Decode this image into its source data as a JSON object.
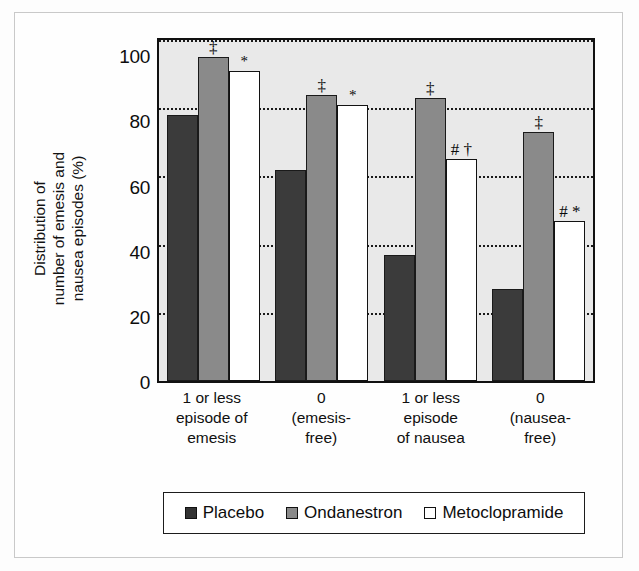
{
  "chart_data": {
    "type": "bar",
    "title": "",
    "xlabel": "",
    "ylabel": "Distribution of number of emesis and nausea episodes (%)",
    "ylabel_lines": [
      "Distribution of",
      "number of emesis and",
      "nausea episodes (%)"
    ],
    "ylim": [
      0,
      100
    ],
    "yticks": [
      100,
      80,
      60,
      40,
      20,
      0
    ],
    "grid": "horizontal-dotted",
    "legend_position": "bottom",
    "categories": [
      "1 or less episode of emesis",
      "0 (emesis-free)",
      "1 or less episode of nausea",
      "0 (nausea-free)"
    ],
    "category_lines": [
      [
        "1 or less",
        "episode of",
        "emesis"
      ],
      [
        "0",
        "(emesis-",
        "free)"
      ],
      [
        "1 or less",
        "episode",
        "of nausea"
      ],
      [
        "0",
        "(nausea-",
        "free)"
      ]
    ],
    "series": [
      {
        "name": "Placebo",
        "color": "#3b3b3b",
        "values": [
          78,
          62,
          37,
          27
        ]
      },
      {
        "name": "Ondanestron",
        "color": "#8a8a8a",
        "values": [
          95,
          84,
          83,
          73
        ]
      },
      {
        "name": "Metoclopramide",
        "color": "#ffffff",
        "values": [
          91,
          81,
          65,
          47
        ]
      }
    ],
    "annotations": [
      {
        "group": 0,
        "series": "Placebo",
        "mark": ""
      },
      {
        "group": 0,
        "series": "Ondanestron",
        "mark": "‡"
      },
      {
        "group": 0,
        "series": "Metoclopramide",
        "mark": "*"
      },
      {
        "group": 1,
        "series": "Placebo",
        "mark": ""
      },
      {
        "group": 1,
        "series": "Ondanestron",
        "mark": "‡"
      },
      {
        "group": 1,
        "series": "Metoclopramide",
        "mark": "*"
      },
      {
        "group": 2,
        "series": "Placebo",
        "mark": ""
      },
      {
        "group": 2,
        "series": "Ondanestron",
        "mark": "‡"
      },
      {
        "group": 2,
        "series": "Metoclopramide",
        "mark": "# †"
      },
      {
        "group": 3,
        "series": "Placebo",
        "mark": ""
      },
      {
        "group": 3,
        "series": "Ondanestron",
        "mark": "‡"
      },
      {
        "group": 3,
        "series": "Metoclopramide",
        "mark": "# *"
      }
    ]
  },
  "axis": {
    "ytick_100": "100",
    "ytick_80": "80",
    "ytick_60": "60",
    "ytick_40": "40",
    "ytick_20": "20",
    "ytick_0": "0"
  },
  "ytitle": {
    "line1": "Distribution of",
    "line2": "number of emesis and",
    "line3": "nausea episodes (%)"
  },
  "xlabels": [
    {
      "l1": "1 or less",
      "l2": "episode of",
      "l3": "emesis"
    },
    {
      "l1": "0",
      "l2": "(emesis-",
      "l3": "free)"
    },
    {
      "l1": "1 or less",
      "l2": "episode",
      "l3": "of nausea"
    },
    {
      "l1": "0",
      "l2": "(nausea-",
      "l3": "free)"
    }
  ],
  "legend": {
    "items": [
      {
        "label": "Placebo",
        "color": "#3b3b3b"
      },
      {
        "label": "Ondanestron",
        "color": "#8a8a8a"
      },
      {
        "label": "Metoclopramide",
        "color": "#ffffff"
      }
    ]
  }
}
